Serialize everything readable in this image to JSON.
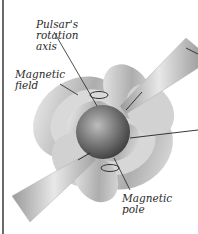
{
  "figure": {
    "subject": "Pulsar",
    "labels": {
      "rotation_axis": [
        "Pulsar's",
        "rotation",
        "axis"
      ],
      "magnetic_field": [
        "Magnetic",
        "field"
      ],
      "magnetic_pole": [
        "Magnetic",
        "pole"
      ]
    },
    "colors": {
      "background": "#ffffff",
      "star": "#7a7a7a",
      "field_lobes": "#b8b8b8",
      "beam": "#c8c8c8",
      "leader_lines": "#222222"
    }
  }
}
